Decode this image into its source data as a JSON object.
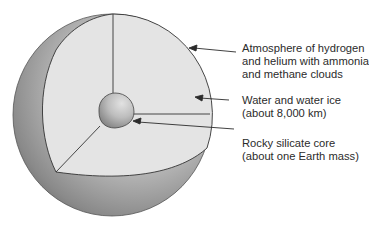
{
  "diagram": {
    "labels": [
      {
        "id": "atmosphere",
        "lines": [
          "Atmosphere of hydrogen",
          "and helium with ammonia",
          "and methane clouds"
        ]
      },
      {
        "id": "water",
        "lines": [
          "Water and water ice",
          "(about 8,000 km)"
        ]
      },
      {
        "id": "core",
        "lines": [
          "Rocky silicate core",
          "(about one Earth mass)"
        ]
      }
    ],
    "colors": {
      "cut_face": "#e4e4e4",
      "outer_shell_dark": "#6e6e6e",
      "outer_shell_light": "#c8c8c8",
      "core_light": "#d6d6d6",
      "core_dark": "#8a8a8a",
      "line": "#2b2b2b"
    }
  }
}
